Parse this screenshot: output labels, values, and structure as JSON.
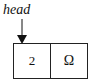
{
  "diagram": {
    "type": "linked-list",
    "pointer": {
      "label": "head"
    },
    "nodes": [
      {
        "data": "2",
        "next": "Ω"
      }
    ]
  }
}
